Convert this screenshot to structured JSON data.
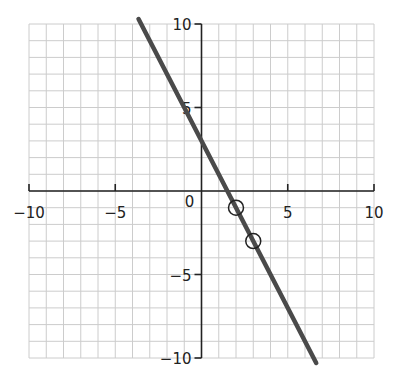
{
  "chart_data": {
    "type": "line",
    "title": "",
    "xlabel": "",
    "ylabel": "",
    "xlim": [
      -10,
      10
    ],
    "ylim": [
      -10,
      10
    ],
    "grid": true,
    "grid_step": 1,
    "x_ticks": [
      -10,
      -5,
      0,
      5,
      10
    ],
    "y_ticks": [
      -10,
      -5,
      5,
      10
    ],
    "x_tick_labels": [
      "−10",
      "−5",
      "5",
      "10"
    ],
    "y_tick_labels": [
      "10",
      "5",
      "−5",
      "−10"
    ],
    "origin_label": "0",
    "series": [
      {
        "name": "y = -2x + 3",
        "equation": {
          "slope": -2,
          "intercept": 3
        },
        "x": [
          -3.65,
          6.65
        ],
        "y": [
          10.3,
          -10.3
        ],
        "color": "#4a4a4a"
      }
    ],
    "marked_points": [
      {
        "x": 2,
        "y": -1
      },
      {
        "x": 3,
        "y": -3
      }
    ],
    "legend": null
  },
  "colors": {
    "grid": "#cccccc",
    "axis": "#222222",
    "line": "#4a4a4a",
    "marker": "#222222"
  }
}
